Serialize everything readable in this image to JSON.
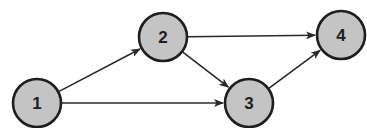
{
  "diagram": {
    "type": "directed-graph",
    "colors": {
      "node_fill": "#c4c4c4",
      "node_stroke": "#1e1e1e",
      "edge": "#2a2a2a",
      "background": "#ffffff"
    },
    "nodes": [
      {
        "id": "1",
        "label": "1",
        "cx": 37,
        "cy": 103,
        "r": 24
      },
      {
        "id": "2",
        "label": "2",
        "cx": 163,
        "cy": 37,
        "r": 24
      },
      {
        "id": "3",
        "label": "3",
        "cx": 249,
        "cy": 103,
        "r": 24
      },
      {
        "id": "4",
        "label": "4",
        "cx": 341,
        "cy": 35,
        "r": 24
      }
    ],
    "edges": [
      {
        "from": "1",
        "to": "2"
      },
      {
        "from": "1",
        "to": "3"
      },
      {
        "from": "2",
        "to": "4"
      },
      {
        "from": "2",
        "to": "3"
      },
      {
        "from": "3",
        "to": "4"
      }
    ]
  }
}
